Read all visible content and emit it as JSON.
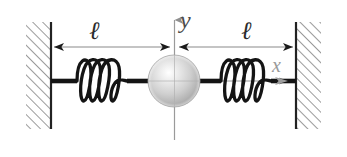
{
  "figure": {
    "background_color": "#ffffff",
    "width": 347,
    "height": 157,
    "labels": {
      "length_left": "ℓ",
      "length_right": "ℓ",
      "axis_vertical": "y",
      "axis_horizontal": "x"
    },
    "colors": {
      "ink": "#1a1a1a",
      "wall_hatch": "#777777",
      "wall_edge": "#222222",
      "dimension_line": "#8a8a8a",
      "axis_line": "#9a9a9a",
      "sphere_light": "#ffffff",
      "sphere_mid": "#c9c9c9",
      "sphere_dark": "#8e8e8e",
      "axis_label_y": "#4a4a4a",
      "axis_label_x": "#9a9a9a"
    },
    "elements": {
      "wall_left_name": "left wall",
      "wall_right_name": "right wall",
      "spring_left_name": "left spring",
      "spring_right_name": "right spring",
      "mass_name": "spherical mass",
      "rod_name": "connecting rod",
      "dimension_left_name": "left length dimension",
      "dimension_right_name": "right length dimension",
      "axis_y_name": "vertical y axis",
      "axis_x_name": "horizontal x axis"
    },
    "geometry": {
      "wall_left_edge_x": 51,
      "wall_right_edge_x": 296,
      "center_x": 174,
      "baseline_y": 81,
      "dimension_y": 47,
      "spring_coils_left": 4,
      "spring_coils_right": 4,
      "sphere_radius": 26
    }
  }
}
